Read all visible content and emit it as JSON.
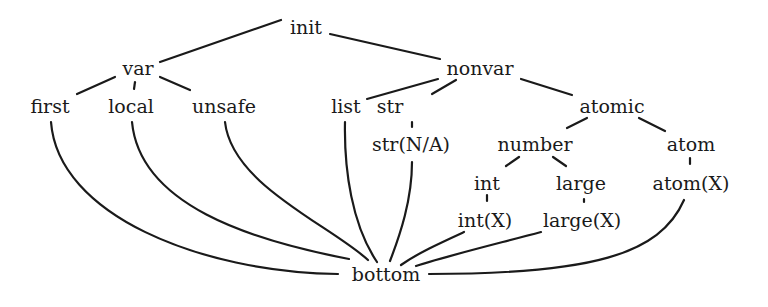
{
  "diagram": {
    "type": "lattice",
    "title": "",
    "colors": {
      "ink": "#1a1a1a",
      "background": "#ffffff"
    },
    "nodes": {
      "init": {
        "label": "init",
        "x": 306,
        "y": 34
      },
      "var": {
        "label": "var",
        "x": 138,
        "y": 75
      },
      "nonvar": {
        "label": "nonvar",
        "x": 480,
        "y": 75
      },
      "first": {
        "label": "first",
        "x": 50,
        "y": 113
      },
      "local": {
        "label": "local",
        "x": 131,
        "y": 113
      },
      "unsafe": {
        "label": "unsafe",
        "x": 224,
        "y": 113
      },
      "list": {
        "label": "list",
        "x": 346,
        "y": 113
      },
      "str": {
        "label": "str",
        "x": 390,
        "y": 113
      },
      "atomic": {
        "label": "atomic",
        "x": 612,
        "y": 113
      },
      "str_na": {
        "label": "str(N/A)",
        "x": 411,
        "y": 151
      },
      "number": {
        "label": "number",
        "x": 535,
        "y": 151
      },
      "atom": {
        "label": "atom",
        "x": 691,
        "y": 151
      },
      "int": {
        "label": "int",
        "x": 487,
        "y": 190
      },
      "large": {
        "label": "large",
        "x": 581,
        "y": 190
      },
      "atom_x": {
        "label": "atom(X)",
        "x": 691,
        "y": 190
      },
      "int_x": {
        "label": "int(X)",
        "x": 485,
        "y": 227
      },
      "large_x": {
        "label": "large(X)",
        "x": 582,
        "y": 227
      },
      "bottom": {
        "label": "bottom",
        "x": 386,
        "y": 281
      }
    },
    "edges": [
      [
        "init",
        "var"
      ],
      [
        "init",
        "nonvar"
      ],
      [
        "var",
        "first"
      ],
      [
        "var",
        "local"
      ],
      [
        "var",
        "unsafe"
      ],
      [
        "nonvar",
        "list"
      ],
      [
        "nonvar",
        "str"
      ],
      [
        "nonvar",
        "atomic"
      ],
      [
        "str",
        "str_na"
      ],
      [
        "atomic",
        "number"
      ],
      [
        "atomic",
        "atom"
      ],
      [
        "number",
        "int"
      ],
      [
        "number",
        "large"
      ],
      [
        "atom",
        "atom_x"
      ],
      [
        "int",
        "int_x"
      ],
      [
        "large",
        "large_x"
      ],
      [
        "first",
        "bottom"
      ],
      [
        "local",
        "bottom"
      ],
      [
        "unsafe",
        "bottom"
      ],
      [
        "list",
        "bottom"
      ],
      [
        "str_na",
        "bottom"
      ],
      [
        "int_x",
        "bottom"
      ],
      [
        "large_x",
        "bottom"
      ],
      [
        "atom_x",
        "bottom"
      ]
    ]
  }
}
